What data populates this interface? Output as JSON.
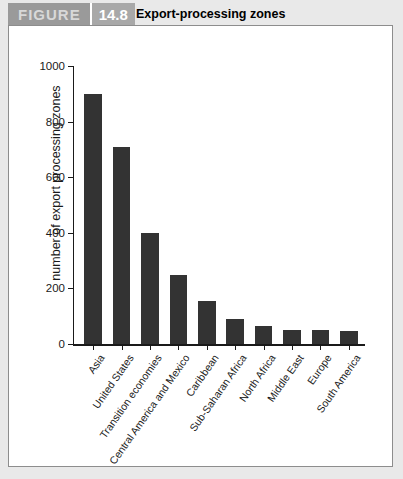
{
  "header": {
    "figure_label": "FIGURE",
    "figure_number": "14.8",
    "title": "Export-processing zones",
    "banner_color": "#9a9a9a",
    "number_block_color": "#a8a8a8"
  },
  "chart_data": {
    "type": "bar",
    "title": "Export-processing zones",
    "xlabel": "",
    "ylabel": "number of export processing zones",
    "ylim": [
      0,
      1000
    ],
    "yticks": [
      0,
      200,
      400,
      600,
      800,
      1000
    ],
    "grid": false,
    "legend": "none",
    "bar_color": "#333333",
    "categories": [
      "Asia",
      "United States",
      "Transition economies",
      "Central America and Mexico",
      "Caribbean",
      "Sub-Saharan Africa",
      "North Africa",
      "Middle East",
      "Europe",
      "South America"
    ],
    "values": [
      900,
      710,
      400,
      250,
      155,
      90,
      65,
      52,
      52,
      45
    ]
  }
}
